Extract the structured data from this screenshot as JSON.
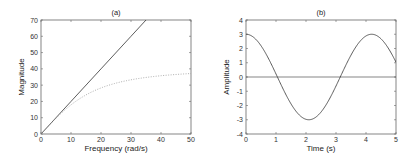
{
  "chart_data": [
    {
      "type": "line",
      "title": "(a)",
      "xlabel": "Frequency (rad/s)",
      "ylabel": "Magnitude",
      "xlim": [
        0,
        50
      ],
      "ylim": [
        0,
        70
      ],
      "xticks": [
        "0",
        "10",
        "20",
        "30",
        "40",
        "50"
      ],
      "yticks": [
        "0",
        "10",
        "20",
        "30",
        "40",
        "50",
        "60",
        "70"
      ],
      "grid": false,
      "series": [
        {
          "name": "solid",
          "style": "solid",
          "x": [
            0,
            10,
            20,
            30,
            35
          ],
          "values": [
            0,
            20,
            40,
            60,
            70
          ]
        },
        {
          "name": "dotted",
          "style": "dotted",
          "x": [
            0,
            5,
            10,
            15,
            20,
            25,
            30,
            35,
            40,
            45,
            50
          ],
          "values": [
            0,
            9.9,
            19.2,
            24.9,
            28.3,
            31.2,
            33.3,
            34.9,
            35.8,
            36.5,
            37.1
          ]
        }
      ]
    },
    {
      "type": "line",
      "title": "(b)",
      "xlabel": "Time (s)",
      "ylabel": "Amplitude",
      "xlim": [
        0,
        5
      ],
      "ylim": [
        -4,
        4
      ],
      "xticks": [
        "0",
        "1",
        "2",
        "3",
        "4",
        "5"
      ],
      "yticks": [
        "-4",
        "-3",
        "-2",
        "-1",
        "0",
        "1",
        "2",
        "3",
        "4"
      ],
      "grid": false,
      "series": [
        {
          "name": "signal",
          "style": "solid",
          "x": [
            0,
            0.5,
            1.0,
            1.05,
            1.5,
            2.09,
            2.5,
            3.0,
            3.14,
            3.5,
            4.19,
            4.5,
            5.0
          ],
          "values": [
            3.0,
            2.19,
            0.21,
            0.0,
            -1.88,
            -3.0,
            -2.46,
            -0.63,
            0.0,
            1.56,
            3.0,
            2.7,
            1.04
          ]
        },
        {
          "name": "zero-line",
          "style": "solid",
          "x": [
            0,
            5
          ],
          "values": [
            0,
            0
          ]
        }
      ]
    }
  ]
}
